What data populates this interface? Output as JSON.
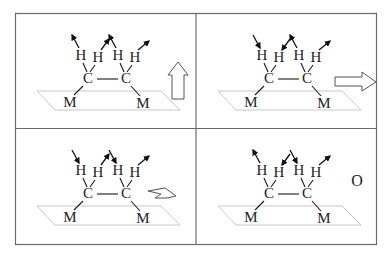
{
  "figure": {
    "colors": {
      "frame": "#6a6a6a",
      "ink": "#1a1a1a",
      "plane": "#c8c8c8",
      "arrow_outline": "#555555"
    },
    "atoms": {
      "hydrogen": "H",
      "carbon": "C",
      "metal": "M"
    },
    "panels": [
      {
        "id": "panel-1",
        "h_motion": [
          "out",
          "out",
          "out",
          "out"
        ],
        "mode_indicator": {
          "type": "arrow-up",
          "label": ""
        }
      },
      {
        "id": "panel-2",
        "h_motion": [
          "in",
          "in",
          "out",
          "out"
        ],
        "mode_indicator": {
          "type": "arrow-right",
          "label": ""
        }
      },
      {
        "id": "panel-3",
        "h_motion": [
          "in",
          "out",
          "in",
          "out"
        ],
        "mode_indicator": {
          "type": "arrow-rotate",
          "label": ""
        }
      },
      {
        "id": "panel-4",
        "h_motion": [
          "out",
          "in",
          "in",
          "out"
        ],
        "mode_indicator": {
          "type": "label",
          "label": "O"
        }
      }
    ]
  }
}
